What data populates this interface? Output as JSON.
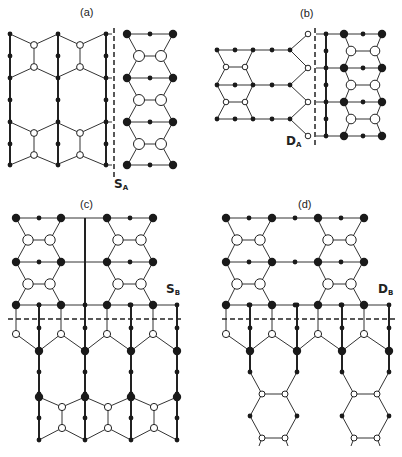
{
  "figure": {
    "panels": [
      {
        "id": "a",
        "label": "(a)",
        "label_pos": [
          80,
          16
        ],
        "defect": {
          "main": "S",
          "sub": "A",
          "pos": [
            114,
            188
          ]
        }
      },
      {
        "id": "b",
        "label": "(b)",
        "label_pos": [
          300,
          17
        ],
        "defect": {
          "main": "D",
          "sub": "A",
          "pos": [
            286,
            145
          ]
        }
      },
      {
        "id": "c",
        "label": "(c)",
        "label_pos": [
          80,
          208
        ],
        "defect": {
          "main": "S",
          "sub": "B",
          "pos": [
            166,
            293
          ]
        }
      },
      {
        "id": "d",
        "label": "(d)",
        "label_pos": [
          298,
          208
        ],
        "defect": {
          "main": "D",
          "sub": "B",
          "pos": [
            378,
            293
          ]
        }
      }
    ],
    "colors": {
      "ink": "#1a1a1a",
      "line": "#333333",
      "background": "#ffffff"
    },
    "dashed_lines": [
      {
        "panel": "a",
        "x1": 114,
        "y1": 28,
        "x2": 114,
        "y2": 178
      },
      {
        "panel": "b",
        "x1": 315,
        "y1": 28,
        "x2": 315,
        "y2": 146
      },
      {
        "panel": "c",
        "x1": 8,
        "y1": 319,
        "x2": 182,
        "y2": 319
      },
      {
        "panel": "d",
        "x1": 222,
        "y1": 319,
        "x2": 396,
        "y2": 319
      }
    ]
  }
}
